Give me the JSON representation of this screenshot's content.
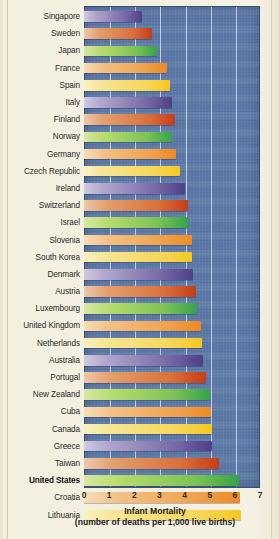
{
  "chart_data": {
    "type": "bar",
    "orientation": "horizontal",
    "title": "Infant Mortality",
    "subtitle": "(number of deaths per 1,000 live births)",
    "xlabel": "",
    "ylabel": "",
    "xlim": [
      0,
      7
    ],
    "xticks": [
      "0",
      "1",
      "2",
      "3",
      "4",
      "5",
      "6",
      "7"
    ],
    "grid": true,
    "legend": false,
    "highlight": "United States",
    "categories": [
      "Singapore",
      "Sweden",
      "Japan",
      "France",
      "Spain",
      "Italy",
      "Finland",
      "Norway",
      "Germany",
      "Czech Republic",
      "Ireland",
      "Switzerland",
      "Israel",
      "Slovenia",
      "South Korea",
      "Denmark",
      "Austria",
      "Luxembourg",
      "United Kingdom",
      "Netherlands",
      "Australia",
      "Portugal",
      "New Zealand",
      "Cuba",
      "Canada",
      "Greece",
      "Taiwan",
      "United States",
      "Croatia",
      "Lithuania"
    ],
    "values": [
      2.3,
      2.7,
      2.9,
      3.3,
      3.4,
      3.5,
      3.6,
      3.5,
      3.65,
      3.8,
      4.0,
      4.15,
      4.15,
      4.3,
      4.3,
      4.35,
      4.45,
      4.5,
      4.65,
      4.7,
      4.75,
      4.85,
      5.0,
      5.05,
      5.1,
      5.1,
      5.35,
      6.15,
      6.2,
      6.25
    ],
    "bar_colors": [
      "#7a6aa8",
      "#d9703a",
      "#7cc255",
      "#f0a24e",
      "#f6d75a"
    ],
    "plot_background": "#5b78a6",
    "page_background": "#f2eedd"
  }
}
